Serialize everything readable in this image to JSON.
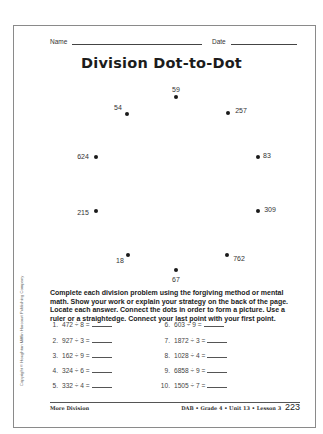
{
  "header": {
    "name_label": "Name",
    "date_label": "Date"
  },
  "title": "Division Dot-to-Dot",
  "dots": [
    {
      "label": "59",
      "dot_x": 176,
      "dot_y": 97,
      "label_x": 176,
      "label_y": 89
    },
    {
      "label": "54",
      "dot_x": 127,
      "dot_y": 114,
      "label_x": 118,
      "label_y": 107
    },
    {
      "label": "257",
      "dot_x": 228,
      "dot_y": 113,
      "label_x": 241,
      "label_y": 110
    },
    {
      "label": "624",
      "dot_x": 96,
      "dot_y": 157,
      "label_x": 83,
      "label_y": 156
    },
    {
      "label": "83",
      "dot_x": 258,
      "dot_y": 157,
      "label_x": 267,
      "label_y": 155
    },
    {
      "label": "215",
      "dot_x": 96,
      "dot_y": 211,
      "label_x": 83,
      "label_y": 212
    },
    {
      "label": "309",
      "dot_x": 258,
      "dot_y": 211,
      "label_x": 270,
      "label_y": 209
    },
    {
      "label": "18",
      "dot_x": 128,
      "dot_y": 255,
      "label_x": 120,
      "label_y": 260
    },
    {
      "label": "762",
      "dot_x": 227,
      "dot_y": 255,
      "label_x": 239,
      "label_y": 258
    },
    {
      "label": "67",
      "dot_x": 176,
      "dot_y": 270,
      "label_x": 176,
      "label_y": 279
    }
  ],
  "instructions": "Complete each division problem using the forgiving method or mental math. Show your work or explain your strategy on the back of the page. Locate each answer. Connect the dots in order to form a picture. Use a ruler or a straightedge. Connect your last point with your first point.",
  "problems": [
    {
      "number": "1.",
      "expression": "472 ÷ 8 ="
    },
    {
      "number": "2.",
      "expression": "927 ÷ 3 ="
    },
    {
      "number": "3.",
      "expression": "162 ÷ 9 ="
    },
    {
      "number": "4.",
      "expression": "324 ÷ 6 ="
    },
    {
      "number": "5.",
      "expression": "332 ÷ 4 ="
    },
    {
      "number": "6.",
      "expression": "603 ÷ 9 ="
    },
    {
      "number": "7.",
      "expression": "1872 ÷ 3 ="
    },
    {
      "number": "8.",
      "expression": "1028 ÷ 4 ="
    },
    {
      "number": "9.",
      "expression": "6858 ÷ 9 ="
    },
    {
      "number": "10.",
      "expression": "1505 ÷ 7 ="
    }
  ],
  "copyright": "Copyright © Houghton Mifflin Harcourt Publishing Company",
  "footer": {
    "left": "More Division",
    "right": "DAB • Grade 4 • Unit 13 • Lesson 3",
    "page": "223"
  }
}
